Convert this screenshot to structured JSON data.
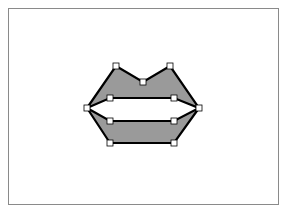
{
  "canvas": {
    "width": 291,
    "height": 212,
    "frame": {
      "x": 8,
      "y": 8,
      "width": 271,
      "height": 197,
      "stroke": "#8a8a8a"
    }
  },
  "shape": {
    "name": "lips",
    "fill": "#9a9a9a",
    "stroke": "#000000",
    "stroke_width": 2.2,
    "upper_lip": {
      "points": [
        [
          87,
          108
        ],
        [
          116,
          66
        ],
        [
          143,
          82
        ],
        [
          170,
          66
        ],
        [
          199,
          108
        ],
        [
          174,
          98
        ],
        [
          110,
          98
        ]
      ]
    },
    "lower_lip": {
      "points": [
        [
          87,
          108
        ],
        [
          110,
          121
        ],
        [
          174,
          121
        ],
        [
          199,
          108
        ],
        [
          174,
          143
        ],
        [
          110,
          143
        ]
      ]
    }
  },
  "handles": {
    "size": 6,
    "fill": "#ffffff",
    "stroke": "#000000",
    "points": [
      {
        "id": "left-corner",
        "x": 87,
        "y": 108
      },
      {
        "id": "upper-left-peak",
        "x": 116,
        "y": 66
      },
      {
        "id": "center-dip",
        "x": 143,
        "y": 82
      },
      {
        "id": "upper-right-peak",
        "x": 170,
        "y": 66
      },
      {
        "id": "right-corner",
        "x": 199,
        "y": 108
      },
      {
        "id": "upper-inner-left",
        "x": 110,
        "y": 98
      },
      {
        "id": "upper-inner-right",
        "x": 174,
        "y": 98
      },
      {
        "id": "lower-inner-left",
        "x": 110,
        "y": 121
      },
      {
        "id": "lower-inner-right",
        "x": 174,
        "y": 121
      },
      {
        "id": "bottom-left",
        "x": 110,
        "y": 143
      },
      {
        "id": "bottom-right",
        "x": 174,
        "y": 143
      }
    ]
  }
}
